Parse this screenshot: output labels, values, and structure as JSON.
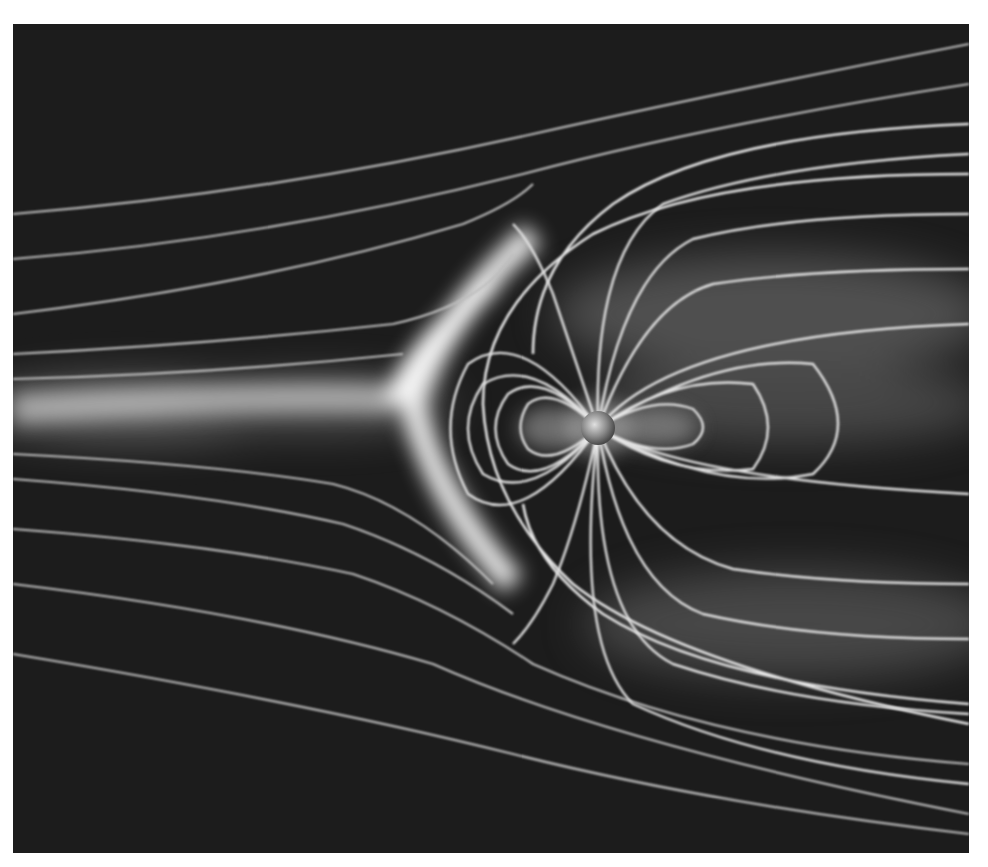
{
  "image": {
    "subject": "Planetary magnetosphere field lines",
    "description": "Grayscale visualization of magnetic field lines around a planet deflected by solar wind, showing bow shock on left and elongated magnetotail on right",
    "colors": {
      "background": "#1c1c1c",
      "field_line": "#d8d8d8",
      "glow": "#ffffff",
      "margin": "#ffffff"
    },
    "planet": {
      "cx": 585,
      "cy": 404,
      "r": 17
    }
  }
}
